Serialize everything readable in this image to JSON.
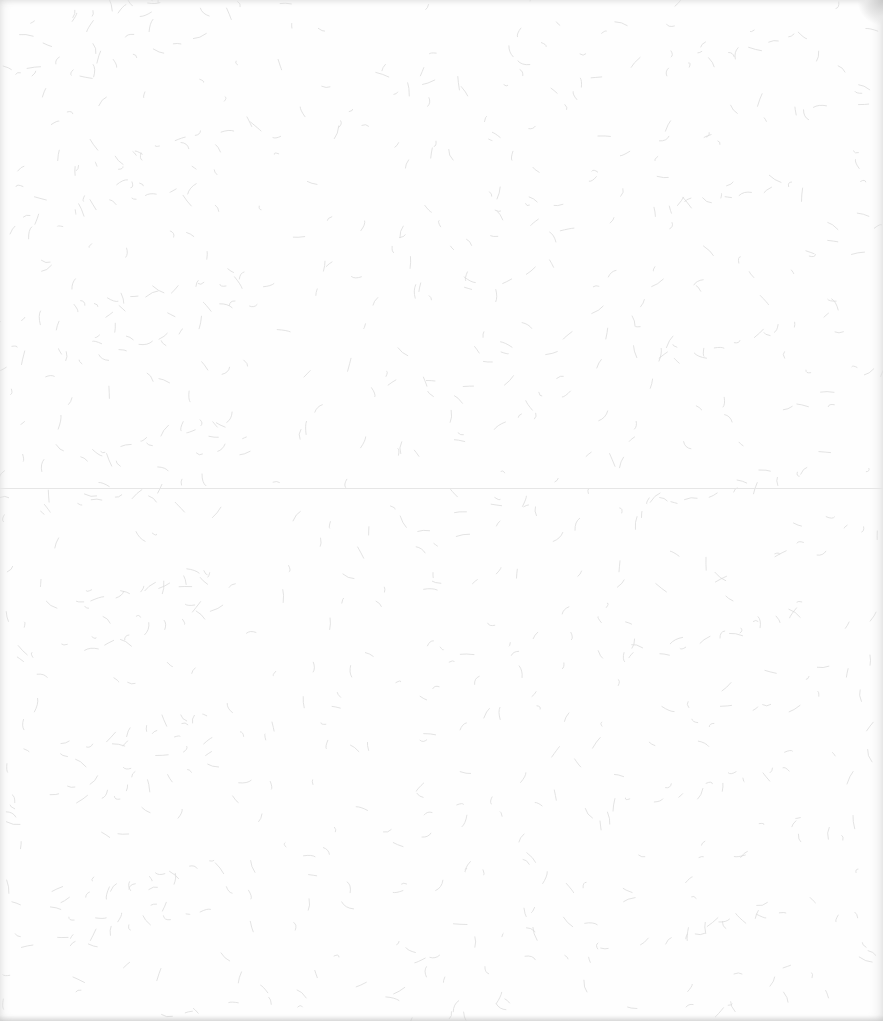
{
  "image": {
    "description": "Blank textured paper sheet with scattered fibers",
    "background_color": "#fefefe",
    "fiber_color": "#dcdcdc",
    "fold_line": {
      "y": 488,
      "color": "#e6e6e6"
    },
    "text_content": []
  }
}
